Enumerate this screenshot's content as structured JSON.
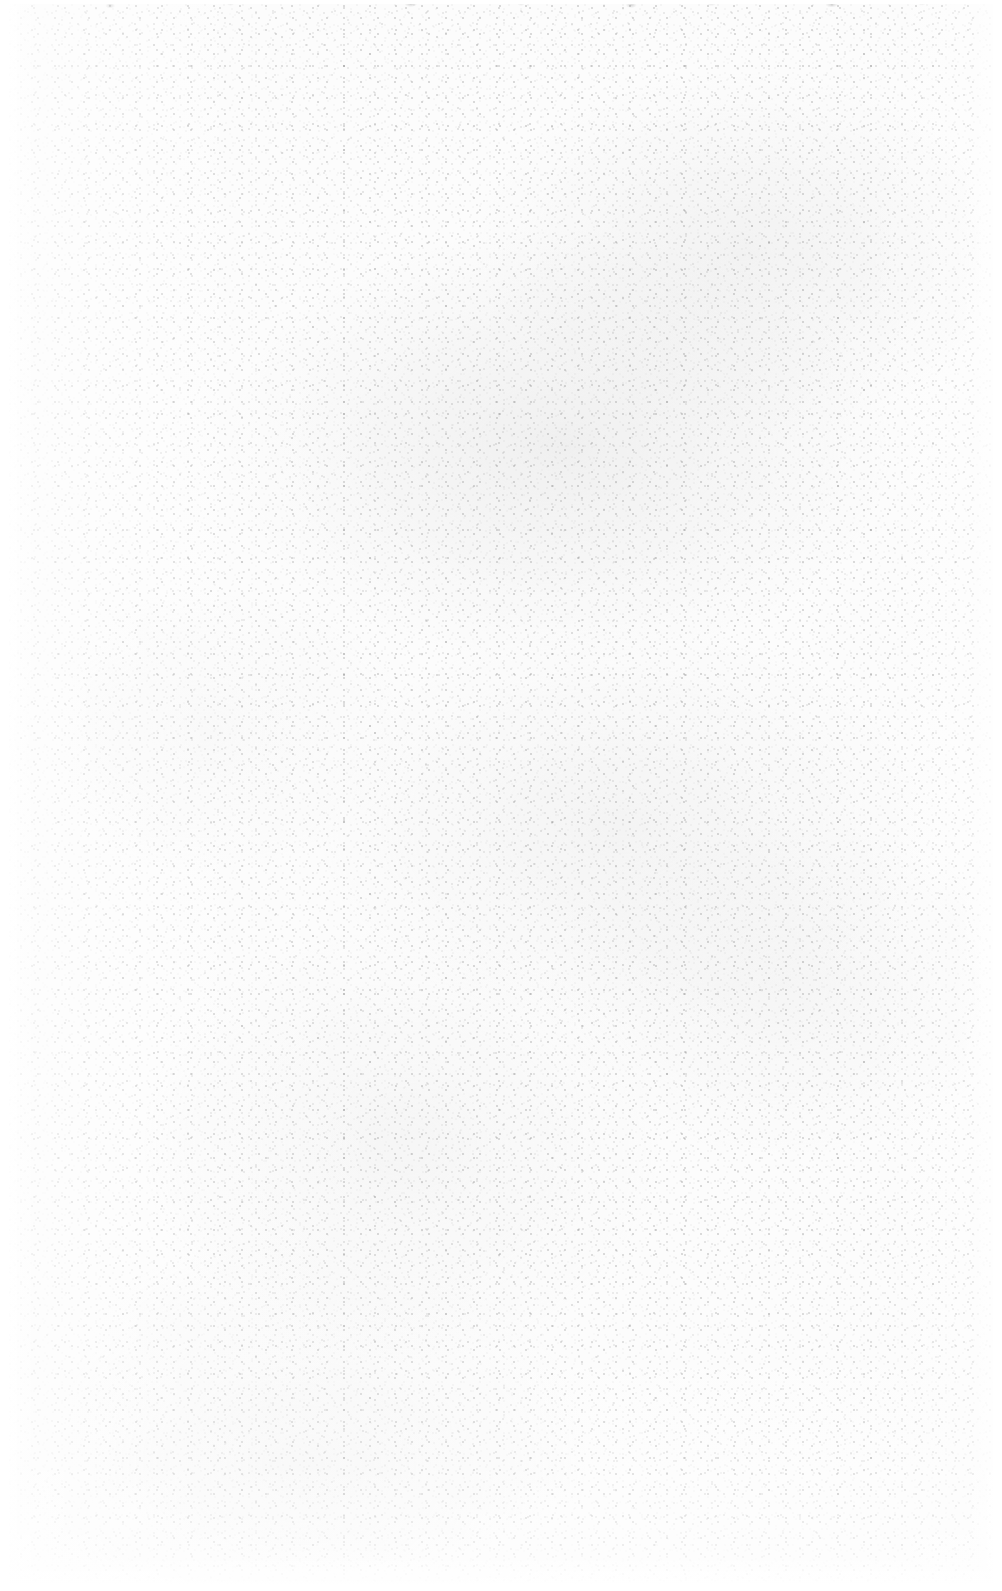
{
  "page": {
    "kind": "scanned-blank-page",
    "width": 1002,
    "height": 1591,
    "orientation": "portrait",
    "text_content": "",
    "has_text": false,
    "has_ui_chrome": false,
    "has_figures": false
  },
  "surface": {
    "paper_color": "#fbfbfb",
    "bleed_margin_color": "#ffffff",
    "speckle_color_dark": "#b8b8b8",
    "speckle_color_mid": "#cccccc",
    "speckle_color_light": "#e2e2e2",
    "top_edge_mark_color": "#969696",
    "speckle_size_px": "1-2",
    "texture": "fine scanner grain / paper fiber speckle"
  },
  "density": {
    "description": "Speckle density is uneven across the sheet",
    "lightest_region": "left edge",
    "densest_region": "center-right and upper-middle",
    "fades_to_white_at": [
      "left edge",
      "right edge",
      "top edge",
      "bottom edge"
    ],
    "bleed_margin_px": {
      "left": 9,
      "right": 9,
      "top": 4,
      "bottom": 7
    }
  }
}
